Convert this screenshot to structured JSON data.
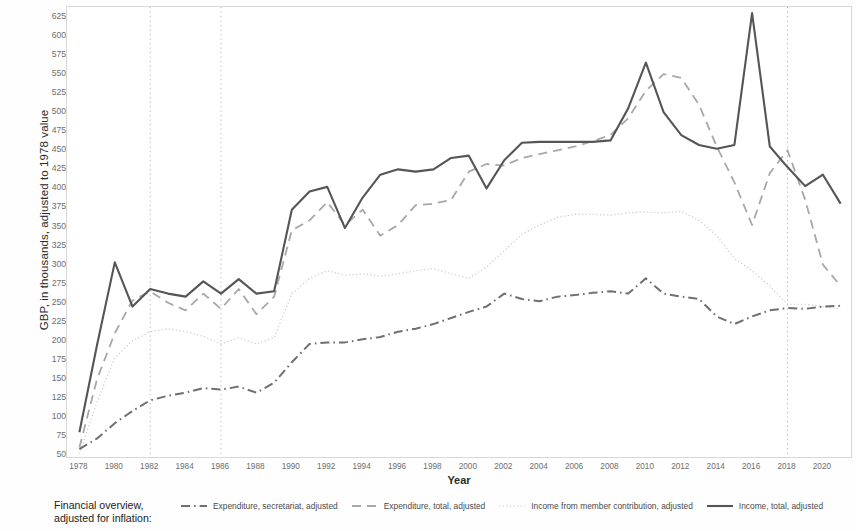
{
  "axes": {
    "ylabel": "GBP, in thousands, adjusted to 1978 value",
    "xlabel": "Year",
    "yticks": [
      50,
      75,
      100,
      125,
      150,
      175,
      200,
      225,
      250,
      275,
      300,
      325,
      350,
      375,
      400,
      425,
      450,
      475,
      500,
      525,
      550,
      575,
      600,
      625
    ],
    "xticks": [
      1978,
      1980,
      1982,
      1984,
      1986,
      1988,
      1990,
      1992,
      1994,
      1996,
      1998,
      2000,
      2002,
      2004,
      2006,
      2008,
      2010,
      2012,
      2014,
      2016,
      2018,
      2020
    ]
  },
  "legend": {
    "title_line1": "Financial overview,",
    "title_line2": "adjusted for inflation:",
    "entries": [
      {
        "label": "Expenditure, secretariat, adjusted",
        "style": "dashdot",
        "color": "#6f6f6f"
      },
      {
        "label": "Expenditure, total, adjusted",
        "style": "dashed",
        "color": "#a8a8a8"
      },
      {
        "label": "Income from member contribution, adjusted",
        "style": "dotted",
        "color": "#c9c9c9"
      },
      {
        "label": "Income, total, adjusted",
        "style": "solid",
        "color": "#555555"
      }
    ]
  },
  "colors": {
    "frame": "#d8d8d8",
    "vline": "#b9b9b9",
    "solid": "#555555",
    "dashed": "#a8a8a8",
    "dotted": "#c9c9c9",
    "dashdot": "#6f6f6f",
    "tick_text": "#6d6d6d"
  },
  "markers": {
    "vertical_lines": [
      1982,
      1986,
      2018
    ]
  },
  "chart_data": {
    "type": "line",
    "title": "Financial overview, adjusted for inflation",
    "xlabel": "Year",
    "ylabel": "GBP, in thousands, adjusted to 1978 value",
    "xlim": [
      1977.3,
      2021.7
    ],
    "ylim": [
      45,
      638
    ],
    "grid": false,
    "legend_position": "bottom",
    "annotations": {
      "vertical_reference_years": [
        1982,
        1986,
        2018
      ]
    },
    "x": [
      1978,
      1979,
      1980,
      1981,
      1982,
      1983,
      1984,
      1985,
      1986,
      1987,
      1988,
      1989,
      1990,
      1991,
      1992,
      1993,
      1994,
      1995,
      1996,
      1997,
      1998,
      1999,
      2000,
      2001,
      2002,
      2003,
      2004,
      2005,
      2006,
      2007,
      2008,
      2009,
      2010,
      2011,
      2012,
      2013,
      2014,
      2015,
      2016,
      2017,
      2018,
      2019,
      2020,
      2021
    ],
    "series": [
      {
        "name": "Income, total, adjusted",
        "style": "solid",
        "color": "#555555",
        "values": [
          80,
          195,
          303,
          245,
          268,
          262,
          258,
          278,
          262,
          281,
          262,
          265,
          372,
          396,
          402,
          348,
          388,
          418,
          425,
          422,
          425,
          440,
          443,
          400,
          437,
          460,
          461,
          461,
          461,
          461,
          463,
          505,
          565,
          500,
          470,
          457,
          452,
          457,
          630,
          455,
          428,
          403,
          418,
          380
        ]
      },
      {
        "name": "Expenditure, total, adjusted",
        "style": "dashed",
        "color": "#a8a8a8",
        "values": [
          60,
          150,
          210,
          253,
          265,
          250,
          240,
          262,
          242,
          268,
          235,
          258,
          345,
          358,
          382,
          352,
          372,
          338,
          352,
          378,
          380,
          385,
          422,
          432,
          430,
          440,
          445,
          450,
          455,
          462,
          470,
          492,
          528,
          550,
          545,
          510,
          455,
          408,
          352,
          420,
          450,
          385,
          300,
          272
        ]
      },
      {
        "name": "Income from member contribution, adjusted",
        "style": "dotted",
        "color": "#c9c9c9",
        "values": [
          52,
          120,
          178,
          200,
          212,
          216,
          212,
          206,
          196,
          204,
          196,
          204,
          262,
          282,
          292,
          286,
          288,
          285,
          288,
          292,
          295,
          288,
          282,
          297,
          318,
          340,
          352,
          362,
          366,
          366,
          365,
          368,
          369,
          368,
          370,
          358,
          338,
          308,
          292,
          272,
          248,
          248,
          245,
          242
        ]
      },
      {
        "name": "Expenditure, secretariat, adjusted",
        "style": "dashdot",
        "color": "#6f6f6f",
        "values": [
          58,
          72,
          92,
          108,
          122,
          128,
          132,
          138,
          136,
          140,
          132,
          145,
          172,
          196,
          198,
          198,
          202,
          205,
          212,
          216,
          222,
          230,
          238,
          245,
          262,
          255,
          252,
          258,
          260,
          263,
          265,
          262,
          282,
          262,
          258,
          255,
          232,
          222,
          232,
          240,
          243,
          242,
          245,
          246
        ]
      }
    ]
  }
}
